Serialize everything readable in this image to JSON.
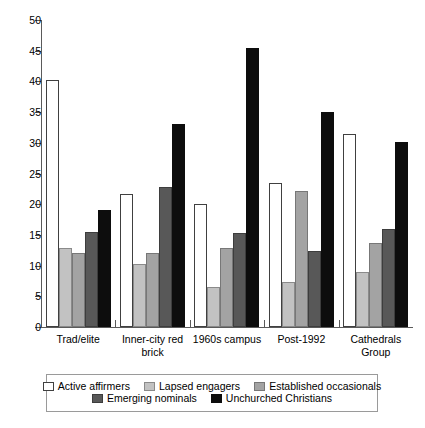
{
  "chart_data": {
    "type": "bar",
    "title": "",
    "xlabel": "",
    "ylabel": "",
    "ylim": [
      0,
      50
    ],
    "yticks": [
      0,
      5,
      10,
      15,
      20,
      25,
      30,
      35,
      40,
      45,
      50
    ],
    "grid": false,
    "legend_position": "bottom",
    "categories": [
      "Trad/elite",
      "Inner-city red brick",
      "1960s campus",
      "Post-1992",
      "Cathedrals Group"
    ],
    "series": [
      {
        "name": "Active affirmers",
        "color": "#ffffff",
        "values": [
          40.2,
          21.7,
          20.1,
          23.5,
          31.5
        ]
      },
      {
        "name": "Lapsed engagers",
        "color": "#c2c2c2",
        "values": [
          12.9,
          10.3,
          6.5,
          7.3,
          9.0
        ]
      },
      {
        "name": "Established occasionals",
        "color": "#a3a3a3",
        "values": [
          12.1,
          12.1,
          12.9,
          22.1,
          13.7
        ]
      },
      {
        "name": "Emerging nominals",
        "color": "#585858",
        "values": [
          15.5,
          22.8,
          15.3,
          12.3,
          16.0
        ]
      },
      {
        "name": "Unchurched Christians",
        "color": "#0d0d0d",
        "values": [
          19.0,
          33.0,
          45.4,
          35.0,
          30.1
        ]
      }
    ]
  }
}
